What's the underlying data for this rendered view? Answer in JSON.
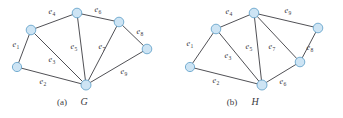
{
  "figure": {
    "width": 343,
    "height": 118,
    "background": "#ffffff",
    "vertex_fill": "#cde4f4",
    "vertex_stroke": "#6aa6cc",
    "edge_color": "#3c3c42",
    "text_color": "#3a3a42"
  },
  "chart_data": {
    "type": "diagram",
    "subtype": "graph-theory-node-link",
    "title": "",
    "panels": [
      {
        "id": "a",
        "caption_index": "(a)",
        "caption_name": "G",
        "vertices": [
          {
            "id": "v1",
            "x": 17,
            "y": 67,
            "r": 4.6
          },
          {
            "id": "v2",
            "x": 31,
            "y": 30,
            "r": 4.8
          },
          {
            "id": "v3",
            "x": 77,
            "y": 13,
            "r": 4.8
          },
          {
            "id": "v4",
            "x": 119,
            "y": 22,
            "r": 4.8
          },
          {
            "id": "v5",
            "x": 147,
            "y": 49,
            "r": 4.8
          },
          {
            "id": "v6",
            "x": 86,
            "y": 85,
            "r": 5.0
          }
        ],
        "edges": [
          {
            "id": "e1",
            "label": "e",
            "sub": "1",
            "from": "v1",
            "to": "v2",
            "lx": 16,
            "ly": 47
          },
          {
            "id": "e2",
            "label": "e",
            "sub": "2",
            "from": "v1",
            "to": "v6",
            "lx": 43,
            "ly": 84
          },
          {
            "id": "e3",
            "label": "e",
            "sub": "3",
            "from": "v2",
            "to": "v6",
            "lx": 52,
            "ly": 62
          },
          {
            "id": "e4",
            "label": "e",
            "sub": "4",
            "from": "v2",
            "to": "v3",
            "lx": 52,
            "ly": 14
          },
          {
            "id": "e5",
            "label": "e",
            "sub": "5",
            "from": "v3",
            "to": "v6",
            "lx": 74,
            "ly": 49
          },
          {
            "id": "e6",
            "label": "e",
            "sub": "6",
            "from": "v3",
            "to": "v4",
            "lx": 98,
            "ly": 12
          },
          {
            "id": "e7",
            "label": "e",
            "sub": "7",
            "from": "v4",
            "to": "v6",
            "lx": 102,
            "ly": 49
          },
          {
            "id": "e8",
            "label": "e",
            "sub": "8",
            "from": "v4",
            "to": "v5",
            "lx": 140,
            "ly": 34
          },
          {
            "id": "e9",
            "label": "e",
            "sub": "9",
            "from": "v5",
            "to": "v6",
            "lx": 124,
            "ly": 74
          }
        ]
      },
      {
        "id": "b",
        "caption_index": "(b)",
        "caption_name": "H",
        "vertices": [
          {
            "id": "w1",
            "x": 190,
            "y": 67,
            "r": 4.6
          },
          {
            "id": "w2",
            "x": 216,
            "y": 29,
            "r": 4.8
          },
          {
            "id": "w3",
            "x": 254,
            "y": 13,
            "r": 4.8
          },
          {
            "id": "w4",
            "x": 318,
            "y": 28,
            "r": 4.8
          },
          {
            "id": "w5",
            "x": 300,
            "y": 62,
            "r": 4.8
          },
          {
            "id": "w6",
            "x": 262,
            "y": 85,
            "r": 5.0
          }
        ],
        "edges": [
          {
            "id": "e1",
            "label": "e",
            "sub": "1",
            "from": "w1",
            "to": "w2",
            "lx": 190,
            "ly": 46
          },
          {
            "id": "e2",
            "label": "e",
            "sub": "2",
            "from": "w1",
            "to": "w6",
            "lx": 216,
            "ly": 83
          },
          {
            "id": "e3",
            "label": "e",
            "sub": "3",
            "from": "w2",
            "to": "w6",
            "lx": 228,
            "ly": 58
          },
          {
            "id": "e4",
            "label": "e",
            "sub": "4",
            "from": "w2",
            "to": "w3",
            "lx": 229,
            "ly": 14
          },
          {
            "id": "e5",
            "label": "e",
            "sub": "5",
            "from": "w3",
            "to": "w6",
            "lx": 249,
            "ly": 49
          },
          {
            "id": "e6",
            "label": "e",
            "sub": "6",
            "from": "w6",
            "to": "w5",
            "lx": 283,
            "ly": 84
          },
          {
            "id": "e7",
            "label": "e",
            "sub": "7",
            "from": "w3",
            "to": "w5",
            "lx": 272,
            "ly": 49
          },
          {
            "id": "e8",
            "label": "e",
            "sub": "8",
            "from": "w5",
            "to": "w4",
            "lx": 310,
            "ly": 50
          },
          {
            "id": "e9",
            "label": "e",
            "sub": "9",
            "from": "w3",
            "to": "w4",
            "lx": 288,
            "ly": 13
          }
        ]
      }
    ],
    "captions": [
      {
        "index": "(a)",
        "name": "G",
        "ix": 62,
        "iy": 105,
        "nx": 84,
        "ny": 105
      },
      {
        "index": "(b)",
        "name": "H",
        "ix": 232,
        "iy": 105,
        "nx": 255,
        "ny": 105
      }
    ]
  }
}
